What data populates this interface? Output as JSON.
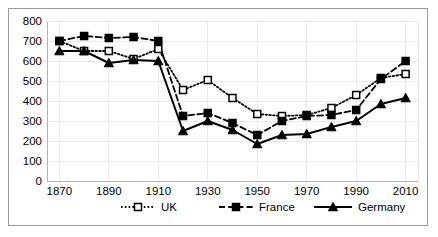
{
  "chart_data": {
    "type": "line",
    "title": "",
    "subtitle": "",
    "xlabel": "",
    "ylabel": "",
    "x": [
      1870,
      1880,
      1890,
      1900,
      1910,
      1920,
      1930,
      1940,
      1950,
      1960,
      1970,
      1980,
      1990,
      2000,
      2010
    ],
    "xticks": [
      1870,
      1890,
      1910,
      1930,
      1950,
      1970,
      1990,
      2010
    ],
    "xtick_labels": [
      "1870",
      "1890",
      "1910",
      "1930",
      "1950",
      "1970",
      "1990",
      "2010"
    ],
    "yticks": [
      0,
      100,
      200,
      300,
      400,
      500,
      600,
      700,
      800
    ],
    "ytick_labels": [
      "0",
      "100",
      "200",
      "300",
      "400",
      "500",
      "600",
      "700",
      "800"
    ],
    "xlim": [
      1865,
      2015
    ],
    "ylim": [
      0,
      800
    ],
    "grid": true,
    "legend_position": "bottom",
    "series": [
      {
        "name": "UK",
        "marker": "open-square",
        "line_style": "dotted",
        "color": "#000000",
        "values": [
          700,
          650,
          650,
          610,
          660,
          455,
          505,
          415,
          335,
          325,
          330,
          365,
          430,
          515,
          535
        ]
      },
      {
        "name": "France",
        "marker": "filled-square",
        "line_style": "dashed",
        "color": "#000000",
        "values": [
          700,
          725,
          715,
          720,
          700,
          325,
          340,
          290,
          230,
          300,
          325,
          330,
          355,
          510,
          600
        ]
      },
      {
        "name": "Germany",
        "marker": "filled-triangle",
        "line_style": "solid",
        "color": "#000000",
        "values": [
          650,
          650,
          590,
          605,
          600,
          250,
          300,
          255,
          185,
          230,
          235,
          270,
          300,
          385,
          415
        ]
      }
    ]
  },
  "legend": {
    "items": [
      {
        "label": "UK"
      },
      {
        "label": "France"
      },
      {
        "label": "Germany"
      }
    ]
  }
}
